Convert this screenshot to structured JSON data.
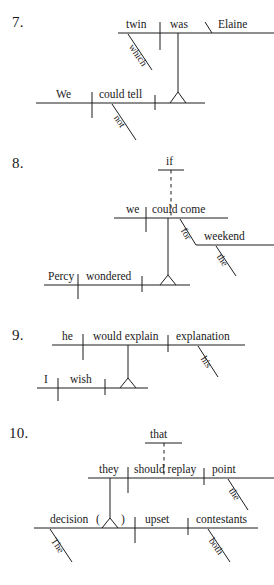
{
  "page": {
    "kind": "sentence-diagrams-worksheet",
    "ink_color": "#1d1d1d",
    "paper_color": "#ffffff"
  },
  "diagrams": [
    {
      "number": "7.",
      "sentence_words": {
        "main_subject": "We",
        "main_verb": "could tell",
        "main_verb_modifier": "not",
        "clause_subject": "twin",
        "clause_verb": "was",
        "clause_complement": "Elaine",
        "clause_relative": "which"
      }
    },
    {
      "number": "8.",
      "sentence_words": {
        "main_subject": "Percy",
        "main_verb": "wondered",
        "clause_subject": "we",
        "clause_verb": "could come",
        "subordinator": "if",
        "preposition": "for",
        "object_of_prep": "weekend",
        "article": "the"
      }
    },
    {
      "number": "9.",
      "sentence_words": {
        "main_subject": "I",
        "main_verb": "wish",
        "clause_subject": "he",
        "clause_verb": "would explain",
        "clause_object": "explanation",
        "possessive": "his"
      }
    },
    {
      "number": "10.",
      "sentence_words": {
        "main_subject": "decision",
        "main_subject_modifier": "The",
        "main_verb": "upset",
        "main_object": "contestants",
        "main_object_modifier": "both",
        "appositive_marker": "(",
        "appositive_marker_close": ")",
        "clause_subject": "they",
        "clause_verb": "should replay",
        "clause_object": "point",
        "clause_object_modifier": "the",
        "subordinator": "that"
      }
    }
  ],
  "labels": {
    "d7": {
      "twin": "twin",
      "was": "was",
      "Elaine": "Elaine",
      "which": "which",
      "We": "We",
      "could_tell": "could tell",
      "not": "not"
    },
    "d8": {
      "if": "if",
      "we": "we",
      "could_come": "could come",
      "for": "for",
      "weekend": "weekend",
      "the": "the",
      "Percy": "Percy",
      "wondered": "wondered"
    },
    "d9": {
      "he": "he",
      "would_explain": "would explain",
      "explanation": "explanation",
      "his": "his",
      "I": "I",
      "wish": "wish"
    },
    "d10": {
      "that": "that",
      "they": "they",
      "should_replay": "should replay",
      "point": "point",
      "the": "the",
      "decision": "decision",
      "paren_open": "(",
      "paren_close": ")",
      "upset": "upset",
      "contestants": "contestants",
      "The": "The",
      "both": "both"
    }
  },
  "numbers": {
    "seven": "7.",
    "eight": "8.",
    "nine": "9.",
    "ten": "10."
  }
}
